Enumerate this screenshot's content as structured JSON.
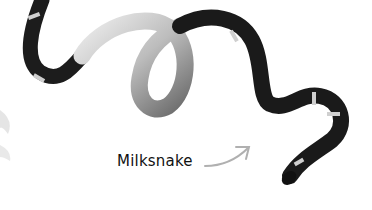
{
  "figure": {
    "label": "Milksnake",
    "colors": {
      "background": "#ffffff",
      "dark_band": "#1a1a1a",
      "light_belly": "#c8c8c8",
      "arrow": "#b0b0b0",
      "text": "#111111"
    }
  }
}
